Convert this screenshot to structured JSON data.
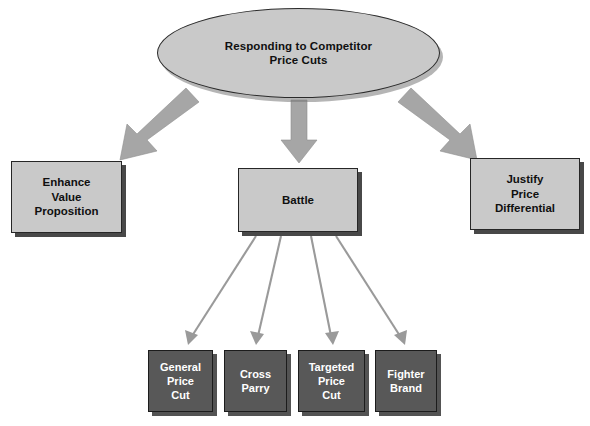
{
  "diagram": {
    "root": {
      "label": "Responding to Competitor\nPrice Cuts",
      "line1": "Responding to Competitor",
      "line2": "Price Cuts",
      "shape": "ellipse",
      "fill": "#c9c9c9",
      "text_color": "#101010"
    },
    "level1": [
      {
        "id": "enhance-value-proposition",
        "line1": "Enhance",
        "line2": "Value",
        "line3": "Proposition",
        "label": "Enhance Value Proposition",
        "fill": "#c9c9c9",
        "text_color": "#101010"
      },
      {
        "id": "battle",
        "line1": "Battle",
        "label": "Battle",
        "fill": "#c9c9c9",
        "text_color": "#101010"
      },
      {
        "id": "justify-price-differential",
        "line1": "Justify",
        "line2": "Price",
        "line3": "Differential",
        "label": "Justify Price Differential",
        "fill": "#c9c9c9",
        "text_color": "#101010"
      }
    ],
    "level2": [
      {
        "id": "general-price-cut",
        "line1": "General",
        "line2": "Price",
        "line3": "Cut",
        "label": "General Price Cut",
        "fill": "#585858",
        "text_color": "#ffffff"
      },
      {
        "id": "cross-parry",
        "line1": "Cross",
        "line2": "Parry",
        "line3": "",
        "label": "Cross Parry",
        "fill": "#585858",
        "text_color": "#ffffff"
      },
      {
        "id": "targeted-price-cut",
        "line1": "Targeted",
        "line2": "Price",
        "line3": "Cut",
        "label": "Targeted Price Cut",
        "fill": "#585858",
        "text_color": "#ffffff"
      },
      {
        "id": "fighter-brand",
        "line1": "Fighter",
        "line2": "Brand",
        "line3": "",
        "label": "Fighter Brand",
        "fill": "#585858",
        "text_color": "#ffffff"
      }
    ],
    "connectors": {
      "thick_arrow_color": "#a6a6a6",
      "thin_arrow_color": "#9a9a9a",
      "from_root": [
        "enhance-value-proposition",
        "battle",
        "justify-price-differential"
      ],
      "from_battle": [
        "general-price-cut",
        "cross-parry",
        "targeted-price-cut",
        "fighter-brand"
      ]
    },
    "background_color": "#ffffff"
  }
}
